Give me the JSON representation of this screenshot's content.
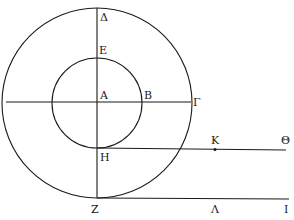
{
  "diagram": {
    "center": {
      "x": 97,
      "y": 102
    },
    "outer_circle": {
      "r": 94
    },
    "inner_circle": {
      "r": 47
    },
    "stroke_color": "#1a1a1a",
    "background": "#ffffff",
    "labels": {
      "delta": "Δ",
      "epsilon": "Ε",
      "alpha": "Α",
      "beta": "Β",
      "gamma": "Γ",
      "eta": "Η",
      "zeta": "Ζ",
      "kappa": "Κ",
      "theta": "Θ",
      "lambda": "Λ",
      "iota": "Ι"
    },
    "segments": [
      {
        "name": "vertical-diameter",
        "from": "Δ",
        "to": "Ζ"
      },
      {
        "name": "horizontal-radius-line",
        "from": "left-edge",
        "to": "Γ"
      },
      {
        "name": "tangent-line-eta",
        "from": "Η",
        "to": "Θ",
        "marked_point": "Κ"
      },
      {
        "name": "tangent-line-zeta",
        "from": "Ζ",
        "to": "Ι",
        "marked_point": "Λ"
      }
    ]
  }
}
